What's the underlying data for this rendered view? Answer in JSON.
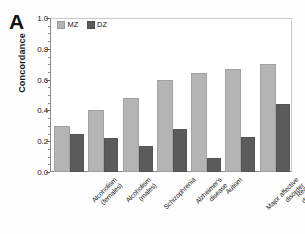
{
  "panel": {
    "label": "A"
  },
  "chart_data": {
    "type": "bar",
    "title": "",
    "xlabel": "",
    "ylabel": "Concordance",
    "ylim": [
      0.0,
      1.0
    ],
    "ytick_labels": [
      "1.0",
      "0.8",
      "0.6",
      "0.4",
      "0.2",
      "0.0"
    ],
    "ytick_values": [
      1.0,
      0.8,
      0.6,
      0.4,
      0.2,
      0.0
    ],
    "grid": false,
    "legend_position": "top-left",
    "categories": [
      "Alcoholism (females)",
      "Alcoholism (males)",
      "Schizophrenia",
      "Alzheimer's disease",
      "Autism",
      "Major affective disorder",
      "Reading disability"
    ],
    "category_lines": [
      [
        "Alcoholism",
        "(females)"
      ],
      [
        "Alcoholism",
        "(males)"
      ],
      [
        "Schizophrenia",
        ""
      ],
      [
        "Alzheimer's",
        "disease"
      ],
      [
        "Autism",
        ""
      ],
      [
        "Major affective",
        "disorder"
      ],
      [
        "Reading",
        "disability"
      ]
    ],
    "series": [
      {
        "name": "MZ",
        "color": "#b4b4b4",
        "values": [
          0.3,
          0.4,
          0.48,
          0.6,
          0.64,
          0.67,
          0.7
        ]
      },
      {
        "name": "DZ",
        "color": "#5b5b5b",
        "values": [
          0.25,
          0.22,
          0.17,
          0.28,
          0.09,
          0.23,
          0.44
        ]
      }
    ]
  }
}
